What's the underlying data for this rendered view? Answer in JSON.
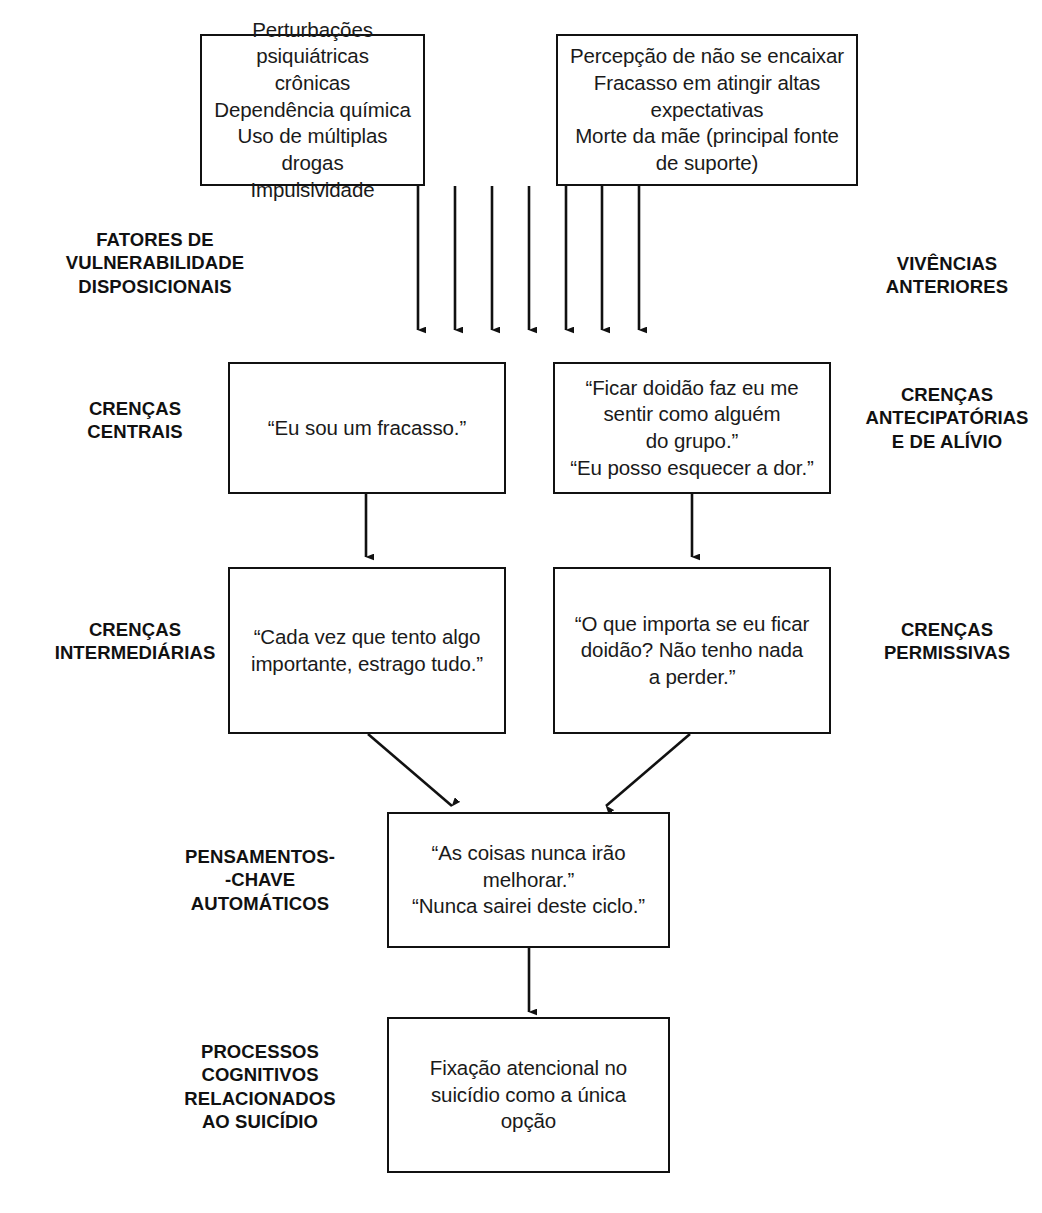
{
  "diagram": {
    "stage_labels": [
      {
        "id": "fatores-vulnerabilidade",
        "text": "FATORES DE\nVULNERABILIDADE\nDISPOSICIONAIS",
        "side": "left"
      },
      {
        "id": "vivencias-anteriores",
        "text": "VIVÊNCIAS\nANTERIORES",
        "side": "right"
      },
      {
        "id": "crencas-centrais",
        "text": "CRENÇAS\nCENTRAIS",
        "side": "left"
      },
      {
        "id": "crencas-antecipatorias",
        "text": "CRENÇAS\nANTECIPATÓRIAS\nE DE ALÍVIO",
        "side": "right"
      },
      {
        "id": "crencas-intermediarias",
        "text": "CRENÇAS\nINTERMEDIÁRIAS",
        "side": "left"
      },
      {
        "id": "crencas-permissivas",
        "text": "CRENÇAS\nPERMISSIVAS",
        "side": "right"
      },
      {
        "id": "pensamentos-chave",
        "text": "PENSAMENTOS-\n-CHAVE\nAUTOMÁTICOS",
        "side": "left"
      },
      {
        "id": "processos-cognitivos",
        "text": "PROCESSOS\nCOGNITIVOS\nRELACIONADOS\nAO SUICÍDIO",
        "side": "left"
      }
    ],
    "boxes": [
      {
        "id": "box-vulnerabilidade",
        "text": "Perturbações psiquiátricas\ncrônicas\nDependência química\nUso de múltiplas drogas\nImpulsividade"
      },
      {
        "id": "box-vivencias",
        "text": "Percepção de não se encaixar\nFracasso em atingir altas\nexpectativas\nMorte da mãe (principal fonte\nde suporte)"
      },
      {
        "id": "box-crenca-central",
        "text": "“Eu sou um fracasso.”"
      },
      {
        "id": "box-crenca-antecipatoria",
        "text": "“Ficar doidão faz eu me\nsentir como alguém\ndo grupo.”\n“Eu posso esquecer a dor.”"
      },
      {
        "id": "box-crenca-intermediaria",
        "text": "“Cada vez que tento algo\nimportante, estrago tudo.”"
      },
      {
        "id": "box-crenca-permissiva",
        "text": "“O que importa se eu ficar\ndoidão? Não tenho nada\na perder.”"
      },
      {
        "id": "box-pensamentos-automaticos",
        "text": "“As coisas nunca irão\nmelhorar.”\n“Nunca sairei deste ciclo.”"
      },
      {
        "id": "box-fixacao-suicidio",
        "text": "Fixação atencional no\nsuicídio como a única\nopção"
      }
    ],
    "colors": {
      "stroke": "#111111",
      "text": "#1a1a1a",
      "background": "#ffffff"
    }
  }
}
